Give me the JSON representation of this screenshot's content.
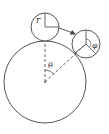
{
  "diagram": {
    "type": "rolling-circle",
    "labels": {
      "small_radius": "r",
      "center_angle": "θ",
      "rotation_angle": "φ"
    },
    "colors": {
      "stroke": "#555555",
      "text": "#333333",
      "background": "#ffffff"
    },
    "large_circle": {
      "cx": 45,
      "cy": 82,
      "r": 41
    },
    "small_circle_start": {
      "cx": 45,
      "cy": 27,
      "r": 14
    },
    "small_circle_end": {
      "cx": 86,
      "cy": 44,
      "r": 14
    }
  }
}
